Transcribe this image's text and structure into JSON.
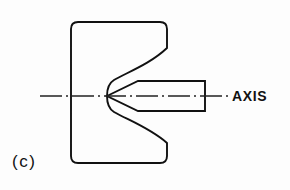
{
  "figure": {
    "caption": "(c)",
    "axis_label": "AXIS",
    "background_color": "#fdfdfd",
    "line_color": "#111111",
    "centerline_color": "#222222",
    "parts": [
      {
        "name": "notched-block",
        "kind": "outline",
        "corner_radius": 7,
        "left": 71,
        "right": 167,
        "top": 22,
        "bottom": 163
      },
      {
        "name": "v-notch",
        "kind": "concave-vee",
        "apex_x": 107,
        "apex_y": 96,
        "mouth_top_y": 48,
        "mouth_bottom_y": 143,
        "mouth_x": 167
      },
      {
        "name": "conical-shaft",
        "kind": "pointed-cylinder",
        "tip_x": 107,
        "tip_y": 96,
        "shoulder_x": 138,
        "end_x": 205,
        "top_y": 81,
        "bottom_y": 111
      },
      {
        "name": "center-axis-line",
        "kind": "dash-dot-centerline",
        "start_x": 40,
        "end_x": 229,
        "y": 96
      }
    ]
  }
}
